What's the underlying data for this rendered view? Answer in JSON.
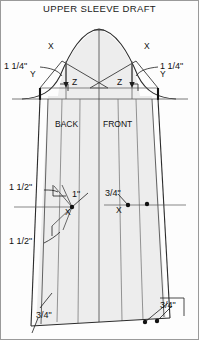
{
  "title": "UPPER SLEEVE DRAFT",
  "colors": {
    "fill": "#ededed",
    "outline": "#2b2b2b",
    "construction": "#555555",
    "frame": "#9a9a9a",
    "text": "#111111"
  },
  "labels": {
    "back": "BACK",
    "front": "FRONT",
    "x_left_cap": "X",
    "y_left_cap": "Y",
    "z_left_cap": "Z",
    "x_right_cap": "X",
    "y_right_cap": "Y",
    "z_right_cap": "Z",
    "x_mid_left": "X",
    "x_mid_right": "X",
    "cap_left_measure": "1 1/4\"",
    "cap_right_measure": "1 1/4\"",
    "upper_left_measure": "1 1/2\"",
    "mid_left_measure": "1\"",
    "mid_right_measure": "3/4\"",
    "lower_left_measure": "1 1/2\"",
    "hem_left_measure": "3/4\"",
    "hem_right_measure": "3/4\""
  },
  "measurements": [
    {
      "name": "cap-left",
      "value": "1 1/4\""
    },
    {
      "name": "cap-right",
      "value": "1 1/4\""
    },
    {
      "name": "underarm-upper-left",
      "value": "1 1/2\""
    },
    {
      "name": "underarm-mid-left",
      "value": "1\""
    },
    {
      "name": "underarm-mid-right",
      "value": "3/4\""
    },
    {
      "name": "underarm-lower-left",
      "value": "1 1/2\""
    },
    {
      "name": "hem-left",
      "value": "3/4\""
    },
    {
      "name": "hem-right",
      "value": "3/4\""
    }
  ],
  "sections": [
    "BACK",
    "FRONT"
  ]
}
